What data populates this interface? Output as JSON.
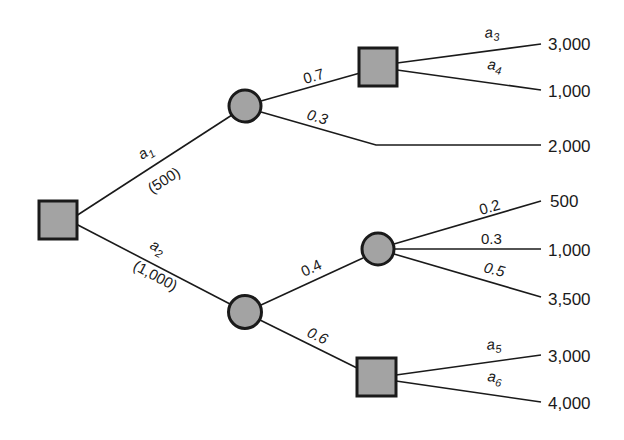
{
  "diagram": {
    "type": "decision-tree",
    "nodes": {
      "root": {
        "kind": "decision",
        "shape": "square"
      },
      "chance_a1": {
        "kind": "chance",
        "shape": "circle"
      },
      "decision_top": {
        "kind": "decision",
        "shape": "square"
      },
      "chance_a2": {
        "kind": "chance",
        "shape": "circle"
      },
      "chance_mid": {
        "kind": "chance",
        "shape": "circle"
      },
      "decision_bottom": {
        "kind": "decision",
        "shape": "square"
      }
    },
    "edges": {
      "a1": {
        "label": "a",
        "sub": "1",
        "cost": "(500)"
      },
      "a2": {
        "label": "a",
        "sub": "2",
        "cost": "(1,000)"
      },
      "p07": {
        "label": "0.7"
      },
      "p03_top": {
        "label": "0.3"
      },
      "a3": {
        "label": "a",
        "sub": "3"
      },
      "a4": {
        "label": "a",
        "sub": "4"
      },
      "p04": {
        "label": "0.4"
      },
      "p06": {
        "label": "0.6"
      },
      "p02": {
        "label": "0.2"
      },
      "p03_mid": {
        "label": "0.3"
      },
      "p05": {
        "label": "0.5"
      },
      "a5": {
        "label": "a",
        "sub": "5"
      },
      "a6": {
        "label": "a",
        "sub": "6"
      }
    },
    "payoffs": {
      "a3": "3,000",
      "a4": "1,000",
      "p03_top": "2,000",
      "p02": "500",
      "p03_mid": "1,000",
      "p05": "3,500",
      "a5": "3,000",
      "a6": "4,000"
    },
    "colors": {
      "node_fill": "#a3a3a3",
      "stroke": "#1a1a1a",
      "background": "#ffffff"
    }
  }
}
